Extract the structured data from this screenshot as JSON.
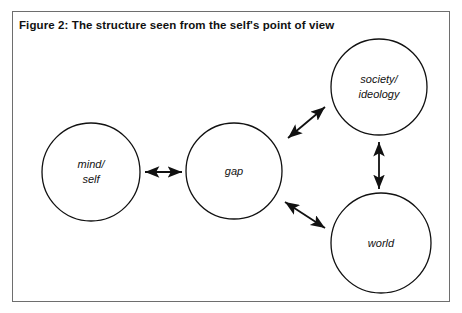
{
  "figure": {
    "title": "Figure 2: The structure seen from the self's point of view",
    "border_color": "#6e6e6e",
    "background": "#ffffff",
    "stroke_color": "#111111"
  },
  "nodes": [
    {
      "id": "mind-self",
      "label_line1": "mind/",
      "label_line2": "self",
      "cx": 91,
      "cy": 172,
      "r": 49
    },
    {
      "id": "gap",
      "label_line1": "gap",
      "label_line2": "",
      "cx": 234,
      "cy": 171,
      "r": 48
    },
    {
      "id": "society-ideology",
      "label_line1": "society/",
      "label_line2": "ideology",
      "cx": 379,
      "cy": 87,
      "r": 48
    },
    {
      "id": "world",
      "label_line1": "world",
      "label_line2": "",
      "cx": 381,
      "cy": 243,
      "r": 50
    }
  ],
  "connectors": [
    {
      "id": "mind-self-to-gap",
      "from": "mind-self",
      "to": "gap",
      "orientation": "horizontal",
      "double_headed": true,
      "x1": 145,
      "y1": 172,
      "x2": 182,
      "y2": 172
    },
    {
      "id": "gap-to-society-ideology",
      "from": "gap",
      "to": "society-ideology",
      "orientation": "diagonal-up-right",
      "double_headed": true,
      "x1": 288,
      "y1": 138,
      "x2": 325,
      "y2": 107
    },
    {
      "id": "gap-to-world",
      "from": "gap",
      "to": "world",
      "orientation": "diagonal-down-right",
      "double_headed": true,
      "x1": 285,
      "y1": 202,
      "x2": 325,
      "y2": 228
    },
    {
      "id": "society-ideology-to-world",
      "from": "society-ideology",
      "to": "world",
      "orientation": "vertical",
      "double_headed": true,
      "x1": 379,
      "y1": 142,
      "x2": 379,
      "y2": 189
    }
  ]
}
